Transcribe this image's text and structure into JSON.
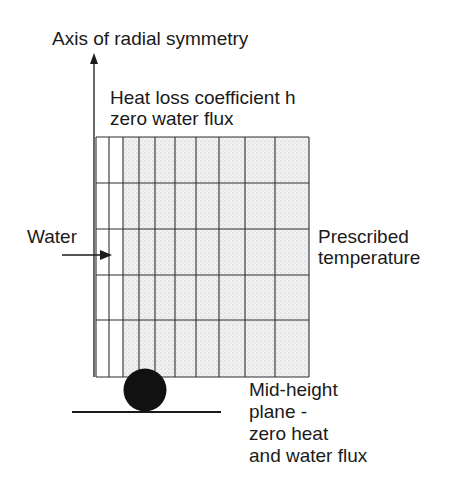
{
  "labels": {
    "axis": "Axis of radial symmetry",
    "top_boundary_line1": "Heat loss coefficient h",
    "top_boundary_line2": "zero water flux",
    "left_inflow": "Water",
    "right_boundary_line1": "Prescribed",
    "right_boundary_line2": "temperature",
    "bottom_boundary_line1": "Mid-height",
    "bottom_boundary_line2": "plane -",
    "bottom_boundary_line3": "zero heat",
    "bottom_boundary_line4": "and water flux"
  },
  "mesh": {
    "columns": 10,
    "rows": 5,
    "x_lines": [
      96,
      109,
      123,
      139,
      155,
      175,
      196,
      219,
      245,
      275,
      309
    ],
    "y_lines": [
      137,
      183,
      229,
      275,
      320,
      377
    ],
    "unshaded_columns": 2
  },
  "colors": {
    "line": "#2a2a2a",
    "fill": "#ececec",
    "specimen": "#111111"
  }
}
